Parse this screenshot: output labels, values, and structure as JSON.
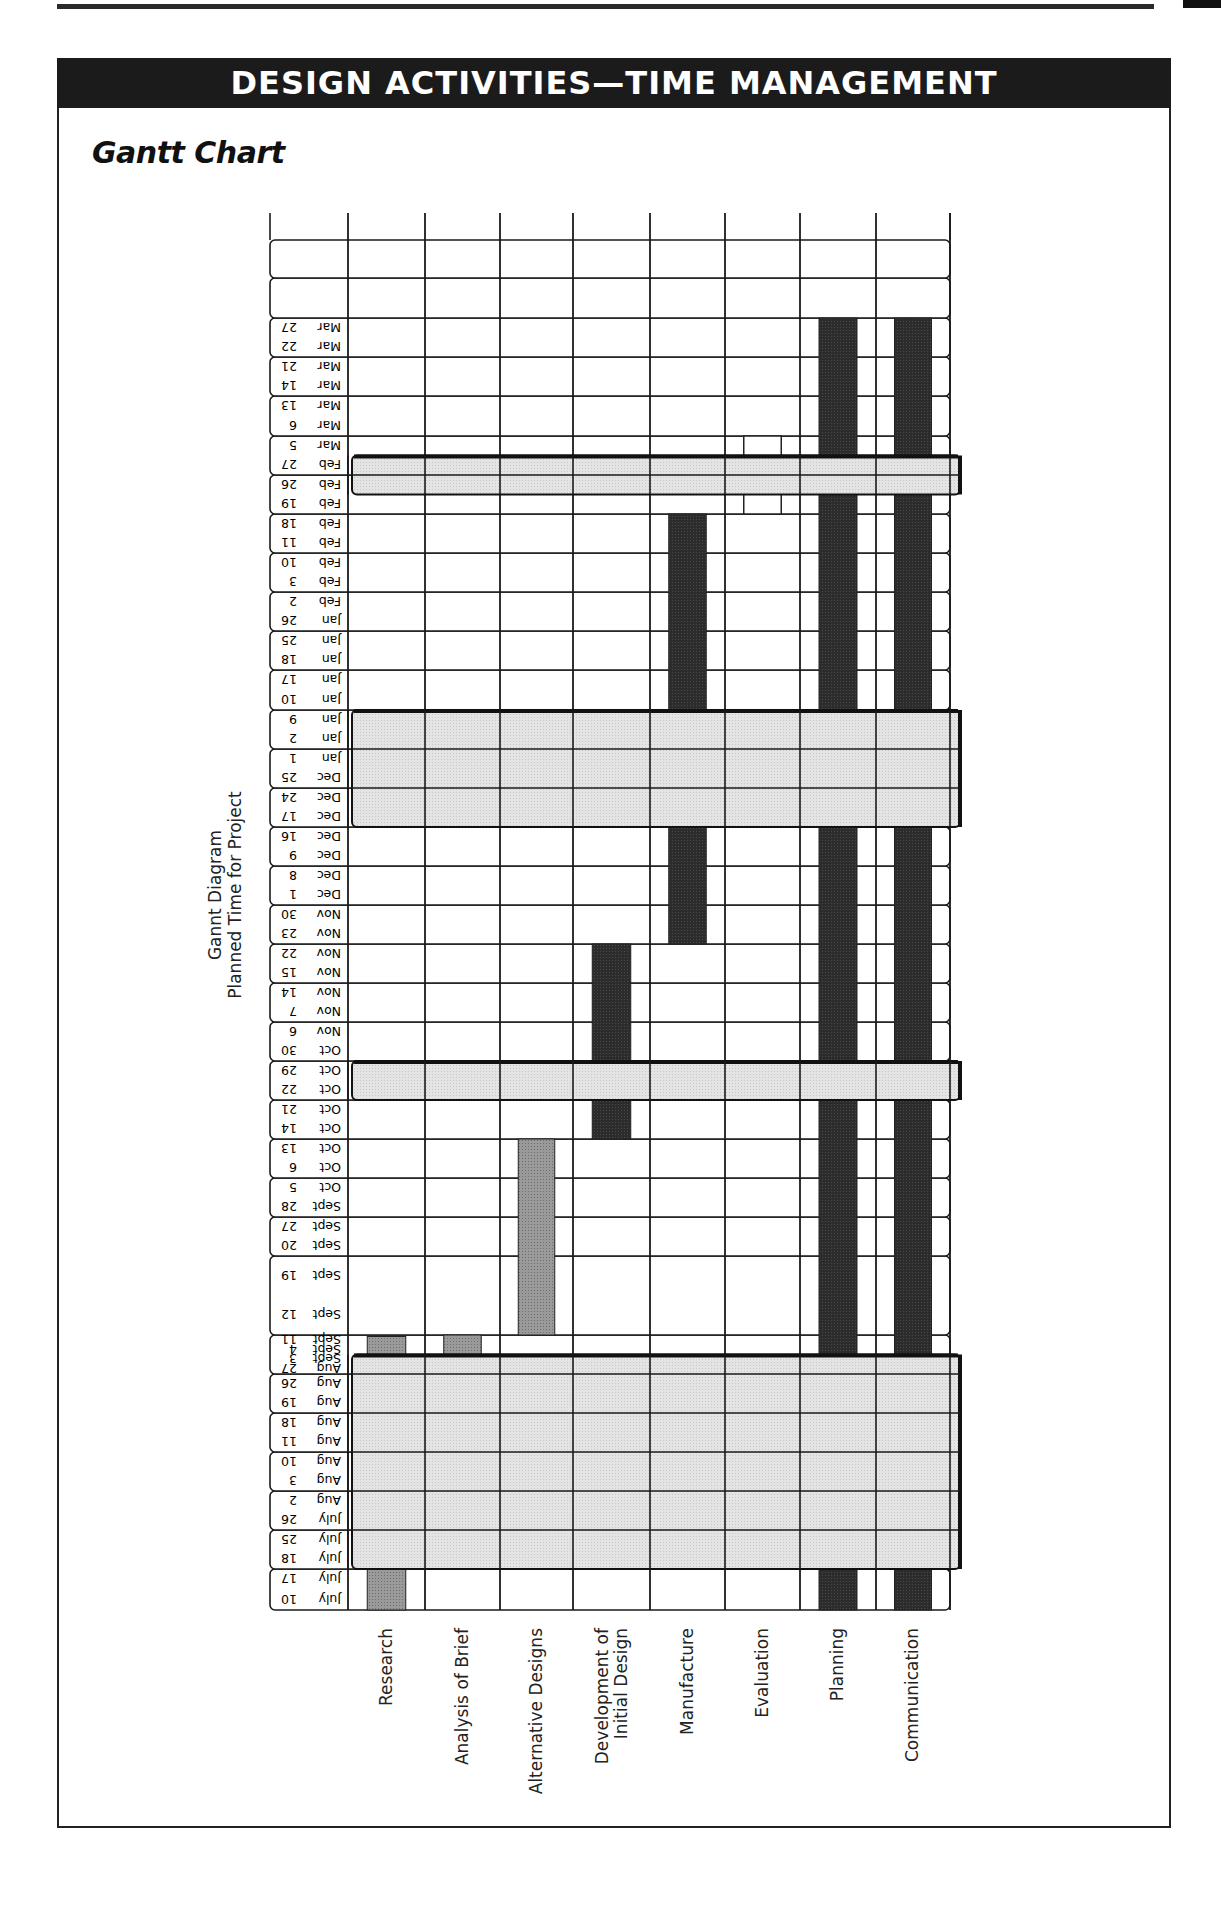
{
  "header": {
    "banner": "DESIGN ACTIVITIES—TIME MANAGEMENT",
    "subtitle": "Gantt Chart"
  },
  "chart_data": {
    "type": "gantt",
    "title": "Gannt Diagram",
    "ylabel": "Planned Time for Project",
    "orientation": "vertical-time (rotated page), activities as columns",
    "categories": [
      "Research",
      "Analysis of Brief",
      "Alternative Designs",
      "Development of Initial Design",
      "Manufacture",
      "Evaluation",
      "Planning",
      "Communication"
    ],
    "time_rows": [
      {
        "dates": [
          "July 10",
          "July 17"
        ]
      },
      {
        "dates": [
          "July 18",
          "July 25"
        ]
      },
      {
        "dates": [
          "July 26",
          "Aug 2"
        ]
      },
      {
        "dates": [
          "Aug 3",
          "Aug 10"
        ]
      },
      {
        "dates": [
          "Aug 11",
          "Aug 18"
        ]
      },
      {
        "dates": [
          "Aug 19",
          "Aug 26"
        ]
      },
      {
        "dates": [
          "Aug 27",
          "Sept 3",
          "Sept 4",
          "Sept 11"
        ]
      },
      {
        "dates": [
          "Sept 12",
          "Sept 19"
        ]
      },
      {
        "dates": [
          "Sept 20",
          "Sept 27"
        ]
      },
      {
        "dates": [
          "Sept 28",
          "Oct 5"
        ]
      },
      {
        "dates": [
          "Oct 6",
          "Oct 13"
        ]
      },
      {
        "dates": [
          "Oct 14",
          "Oct 21"
        ]
      },
      {
        "dates": [
          "Oct 22",
          "Oct 29"
        ]
      },
      {
        "dates": [
          "Oct 30",
          "Nov 6"
        ]
      },
      {
        "dates": [
          "Nov 7",
          "Nov 14"
        ]
      },
      {
        "dates": [
          "Nov 15",
          "Nov 22"
        ]
      },
      {
        "dates": [
          "Nov 23",
          "Nov 30"
        ]
      },
      {
        "dates": [
          "Dec 1",
          "Dec 8"
        ]
      },
      {
        "dates": [
          "Dec 9",
          "Dec 16"
        ]
      },
      {
        "dates": [
          "Dec 17",
          "Dec 24"
        ]
      },
      {
        "dates": [
          "Dec 25",
          "Jan 1"
        ]
      },
      {
        "dates": [
          "Jan 2",
          "Jan 9"
        ]
      },
      {
        "dates": [
          "Jan 10",
          "Jan 17"
        ]
      },
      {
        "dates": [
          "Jan 18",
          "Jan 25"
        ]
      },
      {
        "dates": [
          "Jan 26",
          "Feb 2"
        ]
      },
      {
        "dates": [
          "Feb 3",
          "Feb 10"
        ]
      },
      {
        "dates": [
          "Feb 11",
          "Feb 18"
        ]
      },
      {
        "dates": [
          "Feb 19",
          "Feb 26"
        ]
      },
      {
        "dates": [
          "Feb 27",
          "Mar 5"
        ]
      },
      {
        "dates": [
          "Mar 6",
          "Mar 13"
        ]
      },
      {
        "dates": [
          "Mar 14",
          "Mar 21"
        ]
      },
      {
        "dates": [
          "Mar 22",
          "Mar 27"
        ]
      },
      {
        "dates": []
      },
      {
        "dates": []
      }
    ],
    "tasks": [
      {
        "activity": "Research",
        "start": "July 10",
        "end": "July 17",
        "style": "medium"
      },
      {
        "activity": "Research",
        "start": "Sept 4",
        "end": "Sept 4",
        "style": "medium"
      },
      {
        "activity": "Analysis of Brief",
        "start": "Sept 4",
        "end": "Sept 11",
        "style": "medium"
      },
      {
        "activity": "Alternative Designs",
        "start": "Sept 12",
        "end": "Oct 13",
        "style": "medium"
      },
      {
        "activity": "Development of Initial Design",
        "start": "Oct 14",
        "end": "Nov 22",
        "style": "dark"
      },
      {
        "activity": "Manufacture",
        "start": "Nov 23",
        "end": "Feb 18",
        "style": "dark"
      },
      {
        "activity": "Evaluation",
        "start": "Feb 19",
        "end": "Mar 5",
        "style": "outline"
      },
      {
        "activity": "Planning",
        "start": "July 10",
        "end": "Mar 27",
        "style": "dark"
      },
      {
        "activity": "Communication",
        "start": "July 10",
        "end": "Mar 27",
        "style": "dark"
      }
    ],
    "breaks": [
      {
        "label": "Summer break",
        "start": "July 18",
        "end": "Sept 3"
      },
      {
        "label": "Half term",
        "start": "Oct 22",
        "end": "Oct 29"
      },
      {
        "label": "Christmas break",
        "start": "Dec 17",
        "end": "Jan 9"
      },
      {
        "label": "Half term",
        "start": "Feb 26",
        "end": "Feb 27"
      }
    ],
    "legend": "none",
    "grid": true
  },
  "layout": {
    "grid_left": 270,
    "date_col_right": 348,
    "col_edges": [
      348,
      425,
      500,
      573,
      650,
      725,
      800,
      876,
      950
    ],
    "row_edges_from_bottom": [
      1610,
      1569,
      1530,
      1491,
      1452,
      1413,
      1374,
      1335,
      1256,
      1217,
      1178,
      1139,
      1100,
      1061,
      1022,
      983,
      944,
      905,
      866,
      827,
      788,
      749,
      710,
      670,
      631,
      592,
      553,
      514,
      475,
      436,
      396,
      357,
      318,
      278,
      240
    ],
    "grid_top": 213
  },
  "colors": {
    "banner_bg": "#1b1b1b",
    "dark_bar": "#2c2c2c",
    "medium_bar": "#9a9a9a",
    "break_band": "#e4e4e4",
    "grid_line": "#1a1a1a"
  }
}
